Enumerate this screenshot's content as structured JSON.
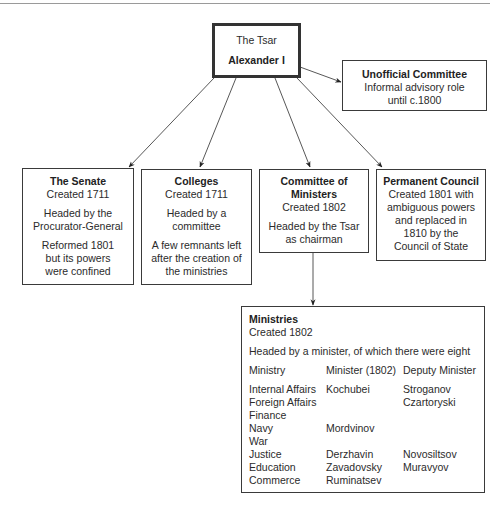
{
  "tsar": {
    "line1": "The Tsar",
    "line2": "Alexander I"
  },
  "unofficial_committee": {
    "title": "Unofficial Committee",
    "lines": [
      "Informal advisory role",
      "until c.1800"
    ]
  },
  "senate": {
    "title": "The Senate",
    "created": "Created 1711",
    "headed": [
      "Headed by the",
      "Procurator-General"
    ],
    "note": [
      "Reformed 1801",
      "but its powers",
      "were confined"
    ]
  },
  "colleges": {
    "title": "Colleges",
    "created": "Created 1711",
    "headed": [
      "Headed by a",
      "committee"
    ],
    "note": [
      "A few remnants left",
      "after the creation of",
      "the ministries"
    ]
  },
  "committee_of_ministers": {
    "title": [
      "Committee of",
      "Ministers"
    ],
    "created": "Created 1802",
    "headed": [
      "Headed by the Tsar",
      "as chairman"
    ]
  },
  "permanent_council": {
    "title": "Permanent Council",
    "lines": [
      "Created 1801 with",
      "ambiguous powers",
      "and replaced in",
      "1810 by the",
      "Council of State"
    ]
  },
  "ministries": {
    "title": "Ministries",
    "created": "Created 1802",
    "headed": "Headed by a minister, of which there were eight",
    "columns": [
      "Ministry",
      "Minister (1802)",
      "Deputy Minister"
    ],
    "rows": [
      [
        "Internal Affairs",
        "Kochubei",
        "Stroganov"
      ],
      [
        "Foreign Affairs",
        "",
        "Czartoryski"
      ],
      [
        "Finance",
        "",
        ""
      ],
      [
        "Navy",
        "Mordvinov",
        ""
      ],
      [
        "War",
        "",
        ""
      ],
      [
        "Justice",
        "Derzhavin",
        "Novosiltsov"
      ],
      [
        "Education",
        "Zavadovsky",
        "Muravyov"
      ],
      [
        "Commerce",
        "Ruminatsev",
        ""
      ]
    ]
  }
}
